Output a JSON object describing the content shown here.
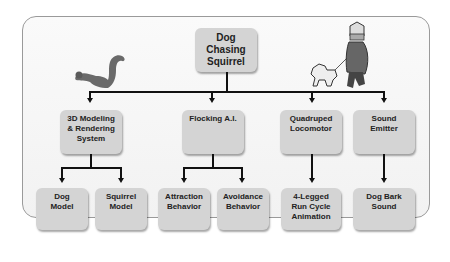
{
  "diagram": {
    "root": {
      "label": "Dog\nChasing\nSquirrel"
    },
    "level1": [
      {
        "label": "3D Modeling\n& Rendering\nSystem"
      },
      {
        "label": "Flocking A.I."
      },
      {
        "label": "Quadruped\nLocomotor"
      },
      {
        "label": "Sound\nEmitter"
      }
    ],
    "level2": [
      {
        "label": "Dog\nModel",
        "parent": "3D Modeling & Rendering System"
      },
      {
        "label": "Squirrel\nModel",
        "parent": "3D Modeling & Rendering System"
      },
      {
        "label": "Attraction\nBehavior",
        "parent": "Flocking A.I."
      },
      {
        "label": "Avoidance\nBehavior",
        "parent": "Flocking A.I."
      },
      {
        "label": "4-Legged\nRun Cycle\nAnimation",
        "parent": "Quadruped Locomotor"
      },
      {
        "label": "Dog Bark\nSound",
        "parent": "Sound Emitter"
      }
    ],
    "illustrations": [
      "squirrel-illustration",
      "man-walking-dog-illustration"
    ]
  }
}
